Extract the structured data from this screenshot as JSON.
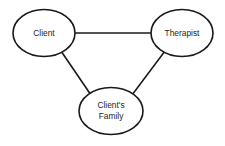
{
  "diagram": {
    "type": "node-link-triad",
    "background_color": "#ffffff",
    "stroke_color": "#1a1a1a",
    "text_color": "#262626",
    "nodes": [
      {
        "id": "client",
        "label": "Client",
        "label_lines": [
          "Client"
        ],
        "shape": "ellipse",
        "cx": 44,
        "cy": 33,
        "rx": 31,
        "ry": 23.5
      },
      {
        "id": "therapist",
        "label": "Therapist",
        "label_lines": [
          "Therapist"
        ],
        "shape": "ellipse",
        "cx": 182,
        "cy": 33,
        "rx": 31,
        "ry": 23.5
      },
      {
        "id": "clients-family",
        "label": "Client's Family",
        "label_lines": [
          "Client's",
          "Family"
        ],
        "shape": "ellipse",
        "cx": 111,
        "cy": 111,
        "rx": 32,
        "ry": 23.5
      }
    ],
    "edges": [
      {
        "id": "client-therapist",
        "from": "client",
        "to": "therapist",
        "style": "solid",
        "x1": 75,
        "y1": 33,
        "x2": 151,
        "y2": 33
      },
      {
        "id": "client-family",
        "from": "client",
        "to": "clients-family",
        "style": "solid",
        "x1": 61,
        "y1": 51,
        "x2": 91,
        "y2": 95
      },
      {
        "id": "therapist-family",
        "from": "therapist",
        "to": "clients-family",
        "style": "solid",
        "x1": 165,
        "y1": 51,
        "x2": 132,
        "y2": 95
      }
    ]
  }
}
